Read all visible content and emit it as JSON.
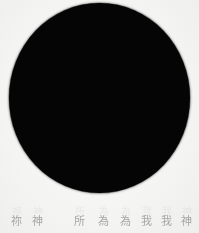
{
  "page": {
    "width_px": 199,
    "height_px": 233,
    "background_color": "#f4f4f2",
    "kind": "scanned-page"
  },
  "figure": {
    "name": "solid-black-circle",
    "shape": "circle",
    "fill_color": "#050505",
    "left_px": 9,
    "top_px": 3,
    "width_px": 181,
    "height_px": 190
  },
  "caption": {
    "text_color": "#9b9b99",
    "glyphs": [
      {
        "char": "祢",
        "left_px": 10,
        "width_px": 13
      },
      {
        "char": "神",
        "left_px": 31,
        "width_px": 13
      },
      {
        "char": "所",
        "left_px": 73,
        "width_px": 13
      },
      {
        "char": "為",
        "left_px": 97,
        "width_px": 13
      },
      {
        "char": "為",
        "left_px": 119,
        "width_px": 13
      },
      {
        "char": "我",
        "left_px": 140,
        "width_px": 13
      },
      {
        "char": "我",
        "left_px": 160,
        "width_px": 13
      },
      {
        "char": "神",
        "left_px": 180,
        "width_px": 13
      }
    ]
  }
}
